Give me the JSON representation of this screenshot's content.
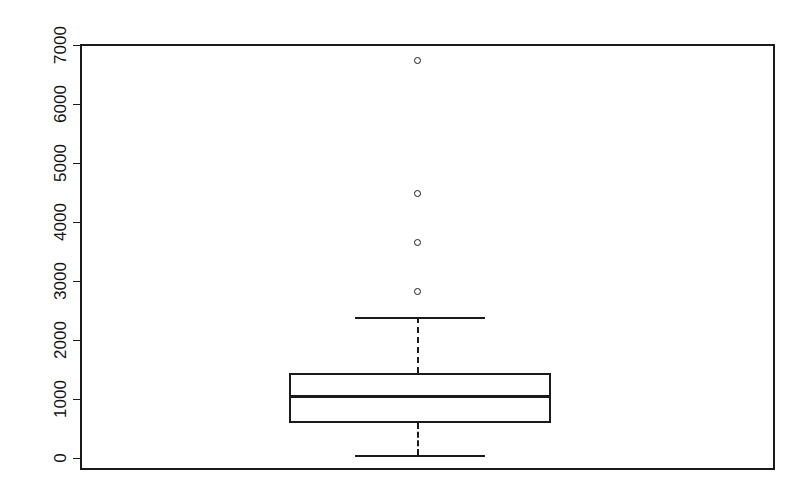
{
  "chart_data": {
    "type": "boxplot",
    "title": "",
    "xlabel": "",
    "ylabel": "",
    "ylim": [
      0,
      7200
    ],
    "grid": false,
    "legend": null,
    "axis": {
      "y_ticks": [
        0,
        1000,
        2000,
        3000,
        4000,
        5000,
        6000,
        7000
      ],
      "y_tick_labels": [
        "0",
        "1000",
        "2000",
        "3000",
        "4000",
        "5000",
        "6000",
        "7000"
      ],
      "y_label_rotation": "-90deg",
      "x_ticks": [],
      "x_tick_labels": []
    },
    "categories": [
      "group-1"
    ],
    "boxes": [
      {
        "name": "group-1",
        "lower_whisker": 50,
        "q1": 595,
        "median": 1050,
        "q3": 1440,
        "upper_whisker": 2390,
        "outliers": [
          2830,
          3660,
          4500,
          6750
        ]
      }
    ]
  },
  "style": {
    "line_color": "#1a1a1a",
    "outlier_marker": "open-circle",
    "whisker_style": "dashed",
    "background": "#ffffff"
  },
  "geometry": {
    "frame": {
      "left": 80,
      "top": 44,
      "right": 773,
      "bottom": 468
    },
    "axis": {
      "tick_top_y": 45,
      "tick_bottom_y": 458,
      "tick_x": 80,
      "tick_len": 7
    },
    "box": {
      "left": 289,
      "right": 551,
      "top": 373,
      "bottom": 423,
      "median_y": 396
    },
    "whisker": {
      "center_x": 417,
      "cap_left": 355,
      "cap_right": 485,
      "upper_y": 317,
      "lower_y": 455
    },
    "outlier_xy": [
      {
        "x": 417,
        "y": 291
      },
      {
        "x": 417,
        "y": 242
      },
      {
        "x": 417,
        "y": 193
      },
      {
        "x": 417,
        "y": 60
      }
    ]
  }
}
